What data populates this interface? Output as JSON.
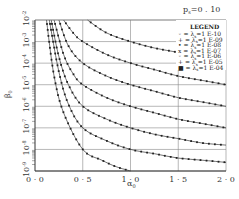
{
  "chart_data": {
    "type": "line",
    "xlabel": "α0",
    "ylabel": "β0",
    "xlim": [
      0.0,
      2.0
    ],
    "ylim": [
      1e-09,
      0.01
    ],
    "yscale": "log",
    "grid": true,
    "legend_position": "upper right",
    "legend_title": "LEGEND",
    "x_ticks": [
      "0.0",
      "0.5",
      "1.0",
      "1.5",
      "2.0"
    ],
    "y_ticks": [
      "10^-9",
      "10^-8",
      "10^-7",
      "10^-6",
      "10^-5",
      "10^-4",
      "10^-3",
      "10^-2"
    ],
    "series": [
      {
        "name": "λs=1 E-10",
        "x": [
          0.12,
          0.2,
          0.3,
          0.5,
          0.7,
          0.85,
          1.0
        ],
        "log10_y": [
          -2.0,
          -4.6,
          -6.3,
          -8.0,
          -8.5,
          -8.8,
          -9.0
        ]
      },
      {
        "name": "λs=1 E-09",
        "x": [
          0.15,
          0.25,
          0.35,
          0.5,
          0.75,
          1.0,
          1.25,
          1.5,
          1.75,
          2.0
        ],
        "log10_y": [
          -2.0,
          -4.4,
          -5.9,
          -7.0,
          -7.6,
          -8.0,
          -8.2,
          -8.4,
          -8.5,
          -8.6
        ]
      },
      {
        "name": "λs=1 E-08",
        "x": [
          0.17,
          0.25,
          0.35,
          0.5,
          0.75,
          1.0,
          1.25,
          1.5,
          1.75,
          2.0
        ],
        "log10_y": [
          -2.0,
          -3.7,
          -5.0,
          -6.0,
          -6.6,
          -7.0,
          -7.3,
          -7.5,
          -7.7,
          -7.8
        ]
      },
      {
        "name": "λs=1 E-07",
        "x": [
          0.2,
          0.3,
          0.4,
          0.5,
          0.75,
          1.0,
          1.25,
          1.5,
          1.75,
          2.0
        ],
        "log10_y": [
          -2.0,
          -3.6,
          -4.5,
          -5.0,
          -5.6,
          -6.0,
          -6.3,
          -6.6,
          -6.8,
          -7.0
        ]
      },
      {
        "name": "λs=1 E-06",
        "x": [
          0.25,
          0.35,
          0.5,
          0.75,
          1.0,
          1.25,
          1.5,
          1.75,
          2.0
        ],
        "log10_y": [
          -2.0,
          -3.2,
          -4.0,
          -4.6,
          -5.0,
          -5.3,
          -5.6,
          -5.8,
          -6.0
        ]
      },
      {
        "name": "λs=1 E-05",
        "x": [
          0.3,
          0.4,
          0.5,
          0.75,
          1.0,
          1.25,
          1.5,
          1.75,
          2.0
        ],
        "log10_y": [
          -2.0,
          -2.6,
          -3.0,
          -3.6,
          -4.0,
          -4.3,
          -4.6,
          -4.8,
          -5.0
        ]
      },
      {
        "name": "λs=1 E-04",
        "x": [
          0.55,
          0.75,
          1.0,
          1.25,
          1.5,
          1.75,
          2.0
        ],
        "log10_y": [
          -2.0,
          -2.6,
          -3.0,
          -3.3,
          -3.5,
          -3.7,
          -3.8
        ]
      }
    ]
  },
  "labels": {
    "title": "p",
    "title_sub": "s",
    "title_value": "=0 . 10",
    "xlabel": "α",
    "xlabel_sub": "0",
    "ylabel": "β",
    "ylabel_sub": "0",
    "legend_title": "LEGEND",
    "legend_items": [
      {
        "sym": "◦ =",
        "lam": "λ",
        "sub": "s",
        "val": "=1  E-10"
      },
      {
        "sym": "+ =",
        "lam": "λ",
        "sub": "s",
        "val": "=1  E-09"
      },
      {
        "sym": "• =",
        "lam": "λ",
        "sub": "s",
        "val": "=1  E-08"
      },
      {
        "sym": "x =",
        "lam": "λ",
        "sub": "s",
        "val": "=1  E-07"
      },
      {
        "sym": "◦ =",
        "lam": "λ",
        "sub": "s",
        "val": "=1  E-06"
      },
      {
        "sym": "+ =",
        "lam": "λ",
        "sub": "s",
        "val": "=1  E-05"
      },
      {
        "sym": "■ =",
        "lam": "λ",
        "sub": "s",
        "val": "=1  E-04"
      }
    ],
    "x_ticks": [
      "0 · 0",
      "0 · 5",
      "1 · 0",
      "1 · 5",
      "2 · 0"
    ],
    "y_tick_base": "10",
    "y_tick_exps": [
      "-9",
      "-8",
      "-7",
      "-6",
      "-5",
      "-4",
      "-3",
      "-2"
    ]
  }
}
